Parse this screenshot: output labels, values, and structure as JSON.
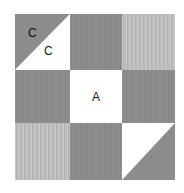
{
  "diagram": {
    "type": "quilt-block-grid",
    "rows": 3,
    "columns": 3,
    "colors": {
      "dark": "#8c8c8c",
      "light": "#bdbdbd",
      "white": "#ffffff",
      "label": "#111111"
    },
    "cells": [
      {
        "row": 1,
        "col": 1,
        "kind": "half-square-triangle",
        "upper_left": "dark",
        "lower_right": "white",
        "labels": {
          "upper_left": "C",
          "lower_right": "C"
        }
      },
      {
        "row": 1,
        "col": 2,
        "kind": "solid",
        "fill": "dark"
      },
      {
        "row": 1,
        "col": 3,
        "kind": "solid",
        "fill": "light"
      },
      {
        "row": 2,
        "col": 1,
        "kind": "solid",
        "fill": "dark"
      },
      {
        "row": 2,
        "col": 2,
        "kind": "solid",
        "fill": "white",
        "label": "A"
      },
      {
        "row": 2,
        "col": 3,
        "kind": "solid",
        "fill": "dark"
      },
      {
        "row": 3,
        "col": 1,
        "kind": "solid",
        "fill": "light"
      },
      {
        "row": 3,
        "col": 2,
        "kind": "solid",
        "fill": "dark"
      },
      {
        "row": 3,
        "col": 3,
        "kind": "half-square-triangle",
        "upper_left": "white",
        "lower_right": "dark"
      }
    ],
    "labels": {
      "c_dark": "C",
      "c_light": "C",
      "a": "A"
    }
  }
}
